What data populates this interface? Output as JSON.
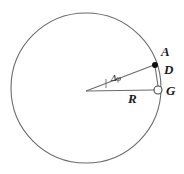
{
  "figure": {
    "kind": "geometry-diagram",
    "title": "",
    "background_color": "#ffffff",
    "stroke_color": "#6b6b6b",
    "label_color": "#1a1a1a",
    "labels": {
      "point_a": "A",
      "segment_d": "D",
      "point_g": "G",
      "radius": "R",
      "angle": "Δφ"
    },
    "geometry": {
      "circle": {
        "cx": 86,
        "cy": 88,
        "r": 75
      },
      "center_point": {
        "x": 86,
        "y": 91
      },
      "point_a": {
        "x": 155,
        "y": 65,
        "marker": "filled-dot",
        "radius": 3
      },
      "point_g": {
        "x": 158,
        "y": 90,
        "marker": "open-circle",
        "radius": 4
      },
      "radius_line_to_g": {
        "x1": 86,
        "y1": 91,
        "x2": 158,
        "y2": 90
      },
      "radius_line_to_a": {
        "x1": 86,
        "y1": 91,
        "x2": 155,
        "y2": 65
      },
      "chord_a_to_g": {
        "x1": 155,
        "y1": 65,
        "x2": 158,
        "y2": 87
      },
      "angle_tick": {
        "x": 106,
        "y1": 79,
        "y2": 88
      },
      "angle_degrees": 20
    }
  }
}
